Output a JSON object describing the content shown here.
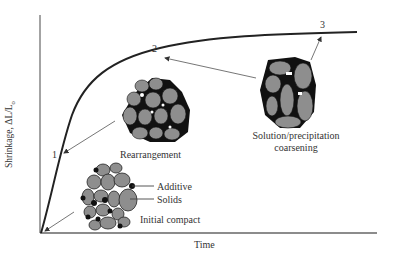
{
  "figure": {
    "y_axis_label": "Shrinkage, ΔL/L",
    "y_axis_label_subscript": "o",
    "x_axis_label": "Time",
    "curve_stage_markers": [
      "1",
      "2",
      "3"
    ],
    "stages": {
      "initial": {
        "label": "Initial compact",
        "callouts": [
          "Additive",
          "Solids"
        ]
      },
      "rearrangement": {
        "label": "Rearrangement"
      },
      "coarsening": {
        "label_line1": "Solution/precipitation",
        "label_line2": "coarsening"
      }
    },
    "colors": {
      "axis": "#555555",
      "curve": "#2a2a2a",
      "particle_fill": "#8c8c8c",
      "particle_outline": "#1a1a1a",
      "additive": "#111111",
      "arrow": "#555555",
      "text": "#333333"
    }
  }
}
